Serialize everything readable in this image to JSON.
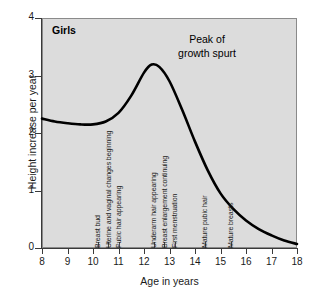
{
  "chart_title": "Girls",
  "peak_annotation": {
    "line1": "Peak of",
    "line2": "growth spurt"
  },
  "axes": {
    "x_title": "Age in years",
    "y_title": "Height increase per year",
    "x_ticks": [
      "8",
      "9",
      "10",
      "11",
      "12",
      "13",
      "14",
      "15",
      "16",
      "17",
      "18"
    ],
    "y_ticks": [
      "4",
      "3",
      "2",
      "1",
      "0"
    ]
  },
  "milestones": [
    {
      "label": "Breast bud",
      "age": 10.2
    },
    {
      "label": "Uterine and vaginal changes  beginning",
      "age": 10.6
    },
    {
      "label": "Pubic hair appearing",
      "age": 11.0
    },
    {
      "label": "Underarm hair appearing",
      "age": 12.4
    },
    {
      "label": "Breast enlargement continuing",
      "age": 12.8
    },
    {
      "label": "First menstruation",
      "age": 13.2
    },
    {
      "label": "Mature pubic hair",
      "age": 14.4
    },
    {
      "label": "Mature breasts",
      "age": 15.4
    }
  ],
  "colors": {
    "plot_background": "#dcdcdc",
    "curve": "#000000",
    "axis": "#3a3a3a",
    "text": "#1a1a1a"
  },
  "chart_data": {
    "type": "line",
    "title": "Girls",
    "xlabel": "Age in years",
    "ylabel": "Height increase per year",
    "xlim": [
      8,
      18
    ],
    "ylim": [
      0,
      4
    ],
    "grid": false,
    "legend": null,
    "x": [
      8,
      8.5,
      9,
      9.5,
      10,
      10.5,
      11,
      11.5,
      12,
      12.3,
      12.6,
      13,
      13.5,
      14,
      14.5,
      15,
      15.5,
      16,
      16.5,
      17,
      17.5,
      18
    ],
    "values": [
      2.25,
      2.2,
      2.17,
      2.15,
      2.15,
      2.2,
      2.35,
      2.65,
      3.05,
      3.19,
      3.15,
      2.9,
      2.4,
      1.85,
      1.35,
      0.95,
      0.68,
      0.48,
      0.33,
      0.22,
      0.13,
      0.07
    ],
    "annotations": [
      {
        "text": "Peak of growth spurt",
        "x": 13.8,
        "y": 3.55
      },
      {
        "text": "Breast bud",
        "x": 10.2,
        "y": 0
      },
      {
        "text": "Uterine and vaginal changes beginning",
        "x": 10.6,
        "y": 0
      },
      {
        "text": "Pubic hair appearing",
        "x": 11.0,
        "y": 0
      },
      {
        "text": "Underarm hair appearing",
        "x": 12.4,
        "y": 0
      },
      {
        "text": "Breast enlargement continuing",
        "x": 12.8,
        "y": 0
      },
      {
        "text": "First menstruation",
        "x": 13.2,
        "y": 0
      },
      {
        "text": "Mature pubic hair",
        "x": 14.4,
        "y": 0
      },
      {
        "text": "Mature breasts",
        "x": 15.4,
        "y": 0
      }
    ]
  }
}
